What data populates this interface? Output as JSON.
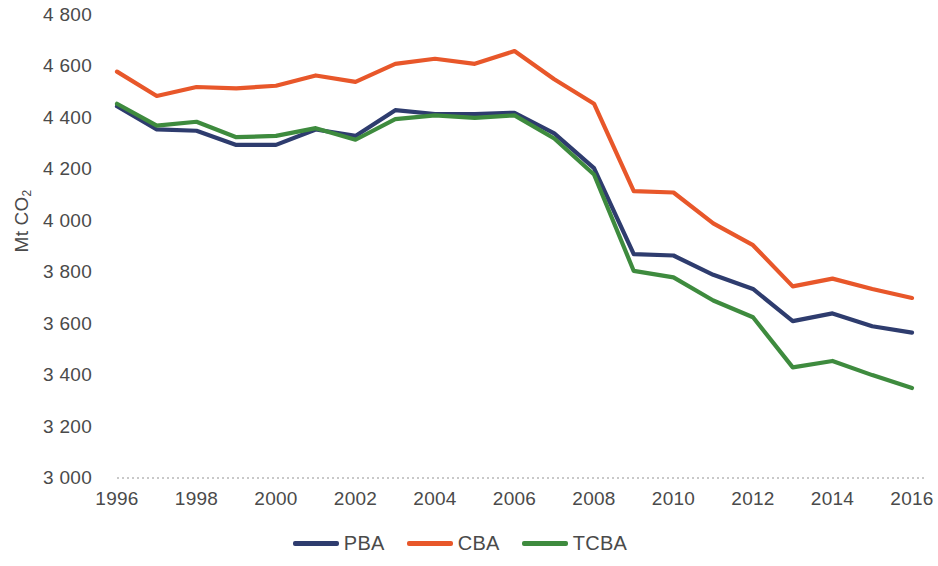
{
  "chart_data": {
    "type": "line",
    "title": "",
    "subtitle": "",
    "xlabel": "",
    "ylabel": "Mt CO2",
    "ylabel_display": "Mt CO",
    "ylabel_sub": "2",
    "x": [
      1996,
      1997,
      1998,
      1999,
      2000,
      2001,
      2002,
      2003,
      2004,
      2005,
      2006,
      2007,
      2008,
      2009,
      2010,
      2011,
      2012,
      2013,
      2014,
      2015,
      2016
    ],
    "xlim": [
      1996,
      2016
    ],
    "ylim": [
      3000,
      4800
    ],
    "ytick_step": 200,
    "xtick_step": 2,
    "grid": false,
    "baseline_style": "dotted",
    "legend_position": "bottom",
    "ytick_labels": [
      "4 800",
      "4 600",
      "4 400",
      "4 200",
      "4 000",
      "3 800",
      "3 600",
      "3 400",
      "3 200",
      "3 000"
    ],
    "ytick_values": [
      4800,
      4600,
      4400,
      4200,
      4000,
      3800,
      3600,
      3400,
      3200,
      3000
    ],
    "xtick_labels": [
      "1996",
      "1998",
      "2000",
      "2002",
      "2004",
      "2006",
      "2008",
      "2010",
      "2012",
      "2014",
      "2016"
    ],
    "xtick_values": [
      1996,
      1998,
      2000,
      2002,
      2004,
      2006,
      2008,
      2010,
      2012,
      2014,
      2016
    ],
    "series": [
      {
        "name": "PBA",
        "color": "#2E3C6E",
        "values": [
          4445,
          4355,
          4350,
          4295,
          4295,
          4355,
          4330,
          4430,
          4415,
          4415,
          4420,
          4340,
          4205,
          3870,
          3865,
          3790,
          3735,
          3610,
          3640,
          3590,
          3565
        ]
      },
      {
        "name": "CBA",
        "color": "#E8572A",
        "values": [
          4580,
          4485,
          4520,
          4515,
          4525,
          4565,
          4540,
          4610,
          4630,
          4610,
          4660,
          4550,
          4455,
          4115,
          4110,
          3990,
          3905,
          3745,
          3775,
          3735,
          3700
        ]
      },
      {
        "name": "TCBA",
        "color": "#3E8B3E",
        "values": [
          4455,
          4370,
          4385,
          4325,
          4330,
          4360,
          4315,
          4395,
          4410,
          4400,
          4410,
          4320,
          4180,
          3805,
          3780,
          3690,
          3625,
          3430,
          3455,
          3400,
          3350
        ]
      }
    ]
  },
  "legend": {
    "items": [
      {
        "label": "PBA",
        "color": "#2E3C6E"
      },
      {
        "label": "CBA",
        "color": "#E8572A"
      },
      {
        "label": "TCBA",
        "color": "#3E8B3E"
      }
    ]
  },
  "colors": {
    "pba": "#2E3C6E",
    "cba": "#E8572A",
    "tcba": "#3E8B3E",
    "text": "#4a4a4a",
    "baseline": "#b8b8b8",
    "background": "#ffffff"
  }
}
